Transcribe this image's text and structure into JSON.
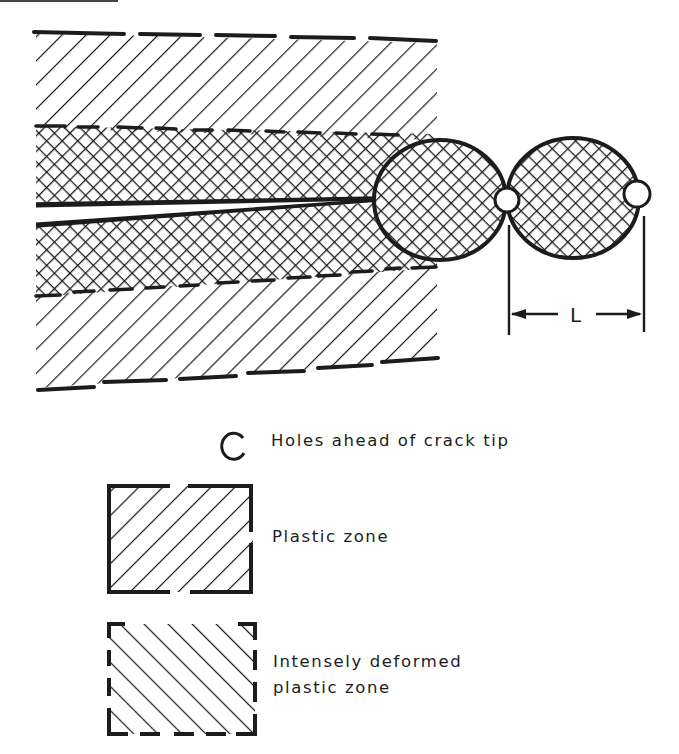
{
  "figure": {
    "dimension_label": "L",
    "colors": {
      "ink": "#1c1c1c",
      "paper": "#ffffff"
    }
  },
  "legend": {
    "items": [
      {
        "icon": "open-circle-icon",
        "label": "Holes ahead of crack tip"
      },
      {
        "icon": "single-hatch-box-icon",
        "label": "Plastic zone"
      },
      {
        "icon": "intense-hatch-box-icon",
        "label_line1": "Intensely deformed",
        "label_line2": "plastic zone"
      }
    ]
  }
}
